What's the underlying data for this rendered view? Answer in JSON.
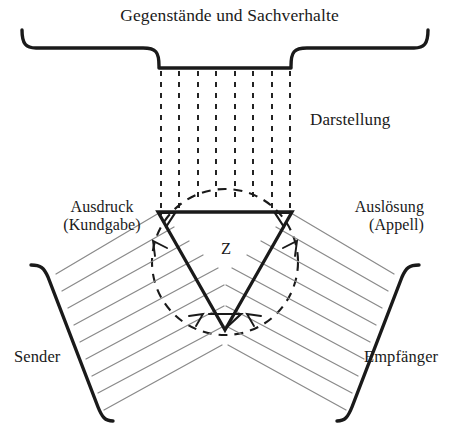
{
  "diagram": {
    "name": "Organon-Modell",
    "background_color": "#ffffff",
    "ink_color": "#1a1a1a",
    "hatch_color": "#8a8a8a",
    "labels": {
      "objects_and_states": "Gegenstände und Sachverhalte",
      "representation": "Darstellung",
      "expression": "Ausdruck",
      "expression_alt": "(Kundgabe)",
      "appeal": "Auslösung",
      "appeal_alt": "(Appell)",
      "sign": "Z",
      "sender": "Sender",
      "receiver": "Empfänger"
    }
  }
}
